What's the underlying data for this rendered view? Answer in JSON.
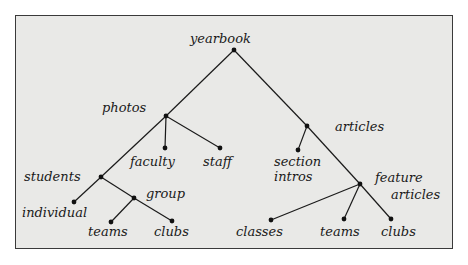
{
  "diagram": {
    "type": "tree",
    "title": "yearbook",
    "colors": {
      "background": "#e9e9e7",
      "border": "#3a3a3a",
      "ink": "#1a1a1a"
    },
    "nodes": [
      {
        "id": "yearbook",
        "label": "yearbook",
        "x": 234,
        "y": 50,
        "lx": 190,
        "ly": 43
      },
      {
        "id": "photos",
        "label": "photos",
        "x": 166,
        "y": 116,
        "lx": 102,
        "ly": 112
      },
      {
        "id": "articles",
        "label": "articles",
        "x": 307,
        "y": 126,
        "lx": 335,
        "ly": 131
      },
      {
        "id": "faculty",
        "label": "faculty",
        "x": 165,
        "y": 148,
        "lx": 130,
        "ly": 166
      },
      {
        "id": "staff",
        "label": "staff",
        "x": 220,
        "y": 148,
        "lx": 203,
        "ly": 166
      },
      {
        "id": "section_intros",
        "label": "section",
        "label2": "intros",
        "x": 298,
        "y": 150,
        "lx": 274,
        "ly": 166,
        "ly2": 181
      },
      {
        "id": "students",
        "label": "students",
        "x": 101,
        "y": 177,
        "lx": 24,
        "ly": 181
      },
      {
        "id": "group",
        "label": "group",
        "x": 134,
        "y": 198,
        "lx": 146,
        "ly": 198
      },
      {
        "id": "feature_articles",
        "label": "feature",
        "label2": "articles",
        "x": 360,
        "y": 184,
        "lx": 375,
        "ly": 182,
        "ly2": 199,
        "lx2": 391
      },
      {
        "id": "individual",
        "label": "individual",
        "x": 74,
        "y": 202,
        "lx": 22,
        "ly": 217
      },
      {
        "id": "teams_photos",
        "label": "teams",
        "x": 111,
        "y": 222,
        "lx": 88,
        "ly": 236
      },
      {
        "id": "clubs_photos",
        "label": "clubs",
        "x": 172,
        "y": 221,
        "lx": 154,
        "ly": 236
      },
      {
        "id": "classes",
        "label": "classes",
        "x": 271,
        "y": 220,
        "lx": 236,
        "ly": 236
      },
      {
        "id": "teams_articles",
        "label": "teams",
        "x": 344,
        "y": 219,
        "lx": 320,
        "ly": 236
      },
      {
        "id": "clubs_articles",
        "label": "clubs",
        "x": 391,
        "y": 219,
        "lx": 381,
        "ly": 236
      }
    ],
    "edges": [
      [
        "yearbook",
        "photos"
      ],
      [
        "yearbook",
        "articles"
      ],
      [
        "photos",
        "faculty"
      ],
      [
        "photos",
        "staff"
      ],
      [
        "photos",
        "students"
      ],
      [
        "students",
        "individual"
      ],
      [
        "students",
        "group"
      ],
      [
        "group",
        "teams_photos"
      ],
      [
        "group",
        "clubs_photos"
      ],
      [
        "articles",
        "section_intros"
      ],
      [
        "articles",
        "feature_articles"
      ],
      [
        "feature_articles",
        "classes"
      ],
      [
        "feature_articles",
        "teams_articles"
      ],
      [
        "feature_articles",
        "clubs_articles"
      ]
    ]
  }
}
